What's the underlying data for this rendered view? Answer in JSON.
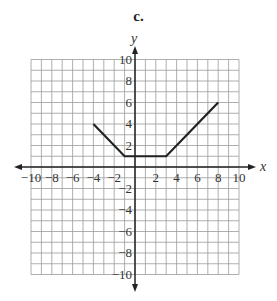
{
  "figure_label": "c.",
  "chart_data": {
    "type": "line",
    "title": "c.",
    "xlabel": "x",
    "ylabel": "y",
    "xlim": [
      -10,
      10
    ],
    "ylim": [
      -10,
      10
    ],
    "grid": true,
    "grid_step": 1,
    "x_ticks": [
      -10,
      -8,
      -6,
      -4,
      -2,
      2,
      4,
      6,
      8,
      10
    ],
    "y_ticks": [
      10,
      8,
      6,
      4,
      2,
      -2,
      -4,
      -6,
      -8,
      -10
    ],
    "series": [
      {
        "name": "piecewise",
        "points": [
          [
            -4,
            4
          ],
          [
            -1,
            1
          ],
          [
            3,
            1
          ],
          [
            8,
            6
          ]
        ],
        "color": "#222222"
      }
    ]
  },
  "colors": {
    "grid": "#9a9a9a",
    "axis": "#222222",
    "line": "#222222",
    "text": "#333333"
  }
}
